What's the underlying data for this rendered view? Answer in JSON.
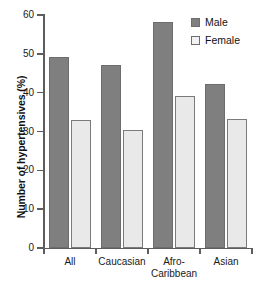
{
  "chart_data": {
    "type": "bar",
    "title": "",
    "xlabel": "",
    "ylabel": "Number of hypertensives (%)",
    "categories": [
      "All",
      "Caucasian",
      "Afro-Caribbean",
      "Asian"
    ],
    "category_lines": [
      [
        "All"
      ],
      [
        "Caucasian"
      ],
      [
        "Afro-",
        "Caribbean"
      ],
      [
        "Asian"
      ]
    ],
    "series": [
      {
        "name": "Male",
        "color": "#7f7f7f",
        "values": [
          49.1,
          47.0,
          58.3,
          42.3
        ]
      },
      {
        "name": "Female",
        "color": "#e9e9e9",
        "values": [
          33.0,
          30.3,
          39.2,
          33.2
        ]
      }
    ],
    "ylim": [
      0,
      60
    ],
    "yticks": [
      0,
      10,
      20,
      30,
      40,
      50,
      60
    ],
    "ytick_labels": [
      "0",
      "10",
      "20",
      "30",
      "40",
      "50",
      "60"
    ],
    "grid": false,
    "legend_position": "top-right",
    "legend": [
      "Male",
      "Female"
    ]
  },
  "legend": {
    "items": [
      {
        "label": "Male",
        "swatch": "male-swatch-icon"
      },
      {
        "label": "Female",
        "swatch": "female-swatch-icon"
      }
    ]
  },
  "axes": {
    "y_title": "Number of hypertensives (%)"
  }
}
